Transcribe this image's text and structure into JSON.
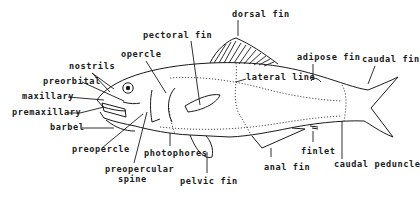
{
  "diagram": {
    "labels": {
      "dorsal_fin": "dorsal fin",
      "pectoral_fin": "pectoral fin",
      "opercle": "opercle",
      "nostrils": "nostrils",
      "preorbital": "preorbital",
      "maxillary": "maxillary",
      "premaxillary": "premaxillary",
      "barbel": "barbel",
      "preopercle": "preopercle",
      "photophores": "photophores",
      "preopercular_spine_1": "preopercular",
      "preopercular_spine_2": "spine",
      "pelvic_fin": "pelvic fin",
      "lateral_line": "lateral line",
      "adipose_fin": "adipose fin",
      "caudal_fin": "caudal fin",
      "anal_fin": "anal fin",
      "finlet": "finlet",
      "caudal_peduncle": "caudal peduncle"
    },
    "colors": {
      "ink": "#1a1a1a",
      "background": "#ffffff"
    }
  }
}
